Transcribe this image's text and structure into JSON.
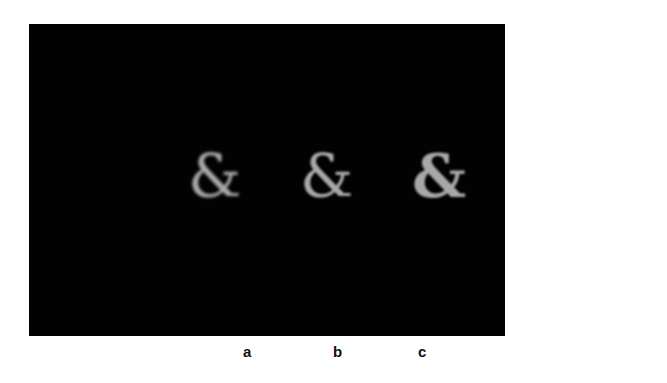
{
  "figure": {
    "background": "#000000",
    "glyph_color": "#a8a8a8",
    "panels": [
      {
        "label": "a",
        "glyph": "&",
        "description": "ampersand rendered as separated dots (lowest sampling)"
      },
      {
        "label": "b",
        "glyph": "&",
        "description": "ampersand with partially merged dots"
      },
      {
        "label": "c",
        "glyph": "&",
        "description": "ampersand with fully merged solid strokes"
      }
    ]
  }
}
